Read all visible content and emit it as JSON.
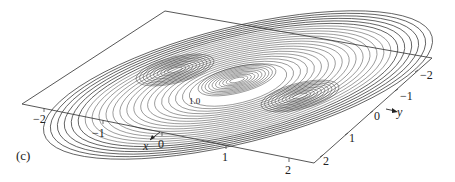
{
  "figure": {
    "panel_label": "(c)",
    "plane_corners": {
      "top": [
        165,
        11
      ],
      "right": [
        432,
        58
      ],
      "bottom": [
        314,
        163
      ],
      "left": [
        22,
        104
      ]
    },
    "x_axis": {
      "name": "x",
      "ticks": [
        {
          "label": "−2",
          "pos": [
            44,
            121
          ]
        },
        {
          "label": "−1",
          "pos": [
            103,
            135
          ]
        },
        {
          "label": "0",
          "pos": [
            162,
            146
          ]
        },
        {
          "label": "1",
          "pos": [
            226,
            159
          ]
        },
        {
          "label": "2",
          "pos": [
            289,
            172
          ]
        }
      ]
    },
    "y_axis": {
      "name": "y",
      "ticks": [
        {
          "label": "−2",
          "pos": [
            424,
            77
          ]
        },
        {
          "label": "−1",
          "pos": [
            405,
            98
          ]
        },
        {
          "label": "0",
          "pos": [
            378,
            118
          ]
        },
        {
          "label": "1",
          "pos": [
            352,
            141
          ]
        },
        {
          "label": "2",
          "pos": [
            325,
            164
          ]
        }
      ]
    },
    "contour_labels": [
      "1.0"
    ],
    "line_color": "#333333",
    "background": "#ffffff"
  },
  "chart_data": {
    "type": "contour",
    "title": "",
    "panel": "(c)",
    "xlabel": "x",
    "ylabel": "y",
    "xlim": [
      -2.5,
      2.5
    ],
    "ylim": [
      -2.5,
      2.5
    ],
    "x_ticks": [
      -2,
      -1,
      0,
      1,
      2
    ],
    "y_ticks": [
      -2,
      -1,
      0,
      1,
      2
    ],
    "contour_level_labels": [
      "1.0"
    ],
    "features": [
      {
        "type": "peak",
        "approx_x": -0.6,
        "approx_y": -1.3
      },
      {
        "type": "peak",
        "approx_x": 0.0,
        "approx_y": 0.0
      },
      {
        "type": "peak",
        "approx_x": 0.6,
        "approx_y": 1.3
      },
      {
        "type": "saddle",
        "approx_x": -0.3,
        "approx_y": -0.6
      },
      {
        "type": "saddle",
        "approx_x": 0.3,
        "approx_y": 0.6
      }
    ],
    "projection": "3D perspective view of contour lines on a plane",
    "grid": false,
    "legend": null
  }
}
